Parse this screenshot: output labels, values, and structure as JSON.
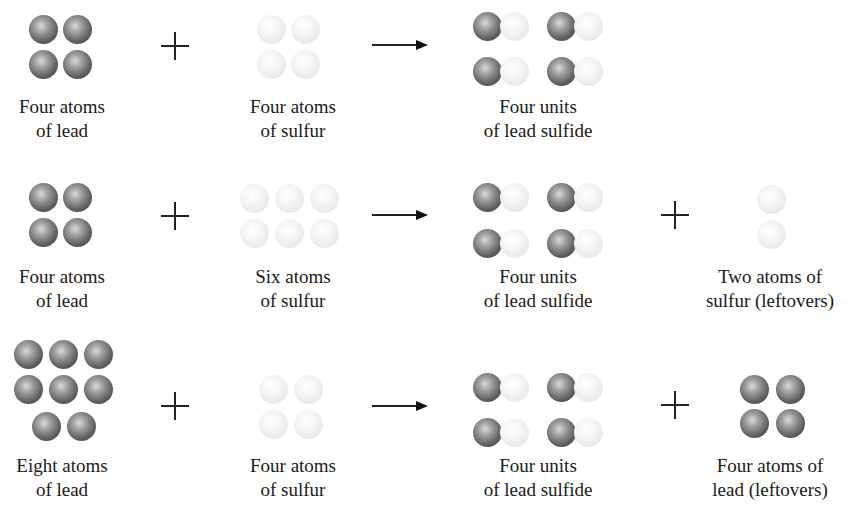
{
  "rows": [
    {
      "reactants": [
        {
          "label": [
            "Four atoms",
            "of lead"
          ],
          "atoms": "lead",
          "count": 4
        },
        {
          "label": [
            "Four atoms",
            "of sulfur"
          ],
          "atoms": "sulfur",
          "count": 4
        }
      ],
      "products": [
        {
          "label": [
            "Four units",
            "of lead sulfide"
          ],
          "atoms": "lead-sulfide",
          "count": 4
        }
      ]
    },
    {
      "reactants": [
        {
          "label": [
            "Four atoms",
            "of lead"
          ],
          "atoms": "lead",
          "count": 4
        },
        {
          "label": [
            "Six atoms",
            "of sulfur"
          ],
          "atoms": "sulfur",
          "count": 6
        }
      ],
      "products": [
        {
          "label": [
            "Four units",
            "of lead sulfide"
          ],
          "atoms": "lead-sulfide",
          "count": 4
        },
        {
          "label": [
            "Two atoms of",
            "sulfur (leftovers)"
          ],
          "atoms": "sulfur",
          "count": 2
        }
      ]
    },
    {
      "reactants": [
        {
          "label": [
            "Eight atoms",
            "of lead"
          ],
          "atoms": "lead",
          "count": 8
        },
        {
          "label": [
            "Four atoms",
            "of sulfur"
          ],
          "atoms": "sulfur",
          "count": 4
        }
      ],
      "products": [
        {
          "label": [
            "Four units",
            "of lead sulfide"
          ],
          "atoms": "lead-sulfide",
          "count": 4
        },
        {
          "label": [
            "Four atoms of",
            "lead (leftovers)"
          ],
          "atoms": "lead",
          "count": 4
        }
      ]
    }
  ],
  "symbols": {
    "plus": "+",
    "arrow": "→"
  },
  "colors": {
    "lead": "#5e5e5e",
    "sulfur": "#ececec",
    "text": "#1a1a1a"
  }
}
